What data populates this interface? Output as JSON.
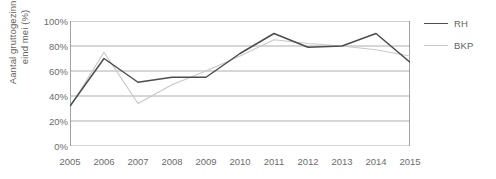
{
  "chart_data": {
    "type": "line",
    "title": "",
    "xlabel": "",
    "ylabel": "Aantal gruttogezinnen eind mei (%)",
    "ylabel_lines": [
      "Aantal gruttogezinnen",
      "eind mei (%)"
    ],
    "categories": [
      "2005",
      "2006",
      "2007",
      "2008",
      "2009",
      "2010",
      "2011",
      "2012",
      "2013",
      "2014",
      "2015"
    ],
    "x": [
      2005,
      2006,
      2007,
      2008,
      2009,
      2010,
      2011,
      2012,
      2013,
      2014,
      2015
    ],
    "ylim": [
      0,
      100
    ],
    "yticks": [
      "0%",
      "20%",
      "40%",
      "60%",
      "80%",
      "100%"
    ],
    "ytick_values": [
      0,
      20,
      40,
      60,
      80,
      100
    ],
    "grid": true,
    "legend_position": "right",
    "series": [
      {
        "name": "RH",
        "color": "#4d4d4d",
        "values": [
          32,
          70,
          51,
          55,
          55,
          74,
          90,
          79,
          80,
          90,
          67
        ]
      },
      {
        "name": "BKP",
        "color": "#c8c8c8",
        "values": [
          31,
          75,
          34,
          49,
          60,
          72,
          85,
          82,
          80,
          77,
          72
        ]
      }
    ]
  },
  "legend": {
    "items": [
      {
        "label": "RH",
        "color": "#4d4d4d"
      },
      {
        "label": "BKP",
        "color": "#c8c8c8"
      }
    ]
  },
  "colors": {
    "axis": "#8c8c8c",
    "grid": "#9a9a9a",
    "text": "#6d6d6d",
    "background": "#ffffff"
  }
}
